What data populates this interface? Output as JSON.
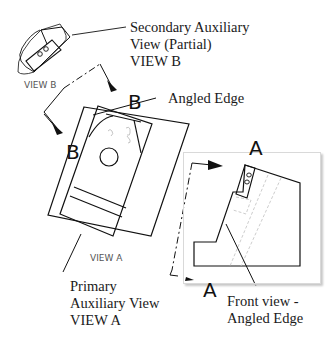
{
  "callouts": {
    "secondary": [
      "Secondary Auxiliary",
      "View (Partial)",
      "VIEW B"
    ],
    "angled_edge": "Angled Edge",
    "primary": [
      "Primary",
      "Auxiliary View",
      "VIEW A"
    ],
    "front": [
      "Front view -",
      "Angled Edge"
    ]
  },
  "view_labels": {
    "view_b": "VIEW B",
    "view_a": "VIEW A"
  },
  "section_letters": {
    "b_top": "B",
    "b_left": "B",
    "a_top": "A",
    "a_bottom": "A"
  },
  "colors": {
    "line": "#111111",
    "hidden": "#b5b5b5",
    "frame": "#d9d9d9"
  }
}
